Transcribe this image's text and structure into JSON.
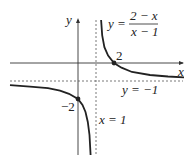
{
  "figure": {
    "function_label": {
      "lhs": "y =",
      "numerator": "2 − x",
      "denominator": "x − 1"
    },
    "axis_labels": {
      "x": "x",
      "y": "y"
    },
    "asymptotes": {
      "vertical": "x = 1",
      "horizontal": "y = −1"
    },
    "points": [
      {
        "label": "2",
        "x": 2,
        "y": 0
      },
      {
        "label": "−2",
        "x": 0,
        "y": -2
      }
    ],
    "colors": {
      "curve": "#222222",
      "axes": "#333333",
      "dashed": "#555555"
    }
  }
}
